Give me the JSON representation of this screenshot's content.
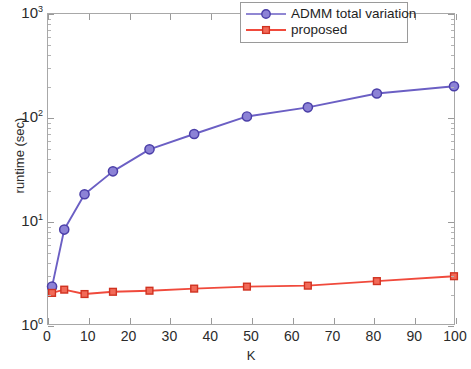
{
  "chart_data": {
    "type": "line",
    "title": "",
    "xlabel": "K",
    "ylabel": "runtime (sec)",
    "xscale": "linear",
    "yscale": "log",
    "xlim": [
      0,
      100
    ],
    "ylim": [
      1,
      1000
    ],
    "grid": false,
    "legend_position": "top-right",
    "x": [
      1,
      4,
      9,
      16,
      25,
      36,
      49,
      64,
      81,
      100
    ],
    "xticks": [
      0,
      10,
      20,
      30,
      40,
      50,
      60,
      70,
      80,
      90,
      100
    ],
    "xtick_labels": [
      "0",
      "10",
      "20",
      "30",
      "40",
      "50",
      "60",
      "70",
      "80",
      "90",
      "100"
    ],
    "yticks": [
      1,
      10,
      100,
      1000
    ],
    "ytick_labels": [
      "10⁰",
      "10¹",
      "10²",
      "10³"
    ],
    "ytick_mantissas": [
      "10",
      "10",
      "10",
      "10"
    ],
    "ytick_exponents": [
      "0",
      "1",
      "2",
      "3"
    ],
    "series": [
      {
        "name": "ADMM total variation",
        "color": "#6B5FC4",
        "marker": "circle",
        "values": [
          2.3,
          8.2,
          18,
          30,
          49,
          69,
          102,
          125,
          170,
          200
        ]
      },
      {
        "name": "proposed",
        "color": "#F04A3C",
        "marker": "square",
        "values": [
          2.0,
          2.15,
          1.95,
          2.05,
          2.1,
          2.2,
          2.3,
          2.35,
          2.6,
          2.9
        ]
      }
    ]
  },
  "legend": {
    "entries": [
      {
        "label": "ADMM total variation"
      },
      {
        "label": "proposed"
      }
    ]
  },
  "axes": {
    "x_title": "K",
    "y_title": "runtime (sec)"
  }
}
